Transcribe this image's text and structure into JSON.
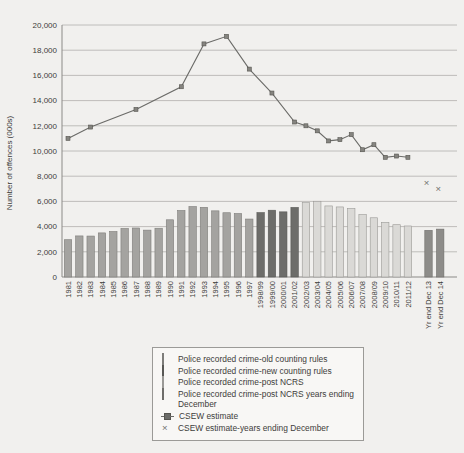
{
  "colors": {
    "background": "#f1f0ee",
    "bar_old": "#a4a3a0",
    "bar_old_stroke": "#7e7d7a",
    "bar_new": "#6d6d6a",
    "bar_new_stroke": "#585855",
    "bar_ncrs": "#dad9d6",
    "bar_ncrs_stroke": "#9a9996",
    "bar_ncrs_dec": "#8d8c89",
    "bar_ncrs_dec_stroke": "#6e6d6a",
    "line": "#6b6b68",
    "line_marker_fill": "#85847f",
    "line_marker_stroke": "#55544f",
    "x_marker": "#6f6f6c",
    "grid": "#b9b7b4",
    "axis": "#8b8a87",
    "text": "#3e3d3b",
    "legend_border": "#9b9a97",
    "legend_bg": "#f8f7f5"
  },
  "markers": {
    "x_glyph": "×"
  },
  "chart_data": {
    "type": "bar+line",
    "title": "",
    "xlabel": "",
    "ylabel": "Number of offences (000s)",
    "ylim": [
      0,
      20000
    ],
    "grid": "horizontal",
    "ytick_values": [
      0,
      2000,
      4000,
      6000,
      8000,
      10000,
      12000,
      14000,
      16000,
      18000,
      20000
    ],
    "ytick_labels": [
      "0",
      "2,000",
      "4,000",
      "6,000",
      "8,000",
      "10,000",
      "12,000",
      "14,000",
      "16,000",
      "18,000",
      "20,000"
    ],
    "categories": [
      "1981",
      "1982",
      "1983",
      "1984",
      "1985",
      "1986",
      "1987",
      "1988",
      "1989",
      "1990",
      "1991",
      "1992",
      "1993",
      "1994",
      "1995",
      "1996",
      "1997",
      "1998/99",
      "1999/00",
      "2000/01",
      "2001/02",
      "2002/03",
      "2003/04",
      "2004/05",
      "2005/06",
      "2006/07",
      "2007/08",
      "2008/09",
      "2009/10",
      "2010/11",
      "2011/12",
      "Yr end Dec 13",
      "Yr end Dec 14"
    ],
    "bar_values": [
      2960,
      3260,
      3250,
      3500,
      3610,
      3850,
      3890,
      3720,
      3870,
      4540,
      5280,
      5590,
      5530,
      5250,
      5100,
      5040,
      4600,
      5110,
      5300,
      5170,
      5520,
      5900,
      6010,
      5640,
      5560,
      5430,
      4950,
      4700,
      4340,
      4150,
      4050,
      3700,
      3800
    ],
    "bar_groups": [
      "old",
      "old",
      "old",
      "old",
      "old",
      "old",
      "old",
      "old",
      "old",
      "old",
      "old",
      "old",
      "old",
      "old",
      "old",
      "old",
      "old",
      "new",
      "new",
      "new",
      "new",
      "ncrs",
      "ncrs",
      "ncrs",
      "ncrs",
      "ncrs",
      "ncrs",
      "ncrs",
      "ncrs",
      "ncrs",
      "ncrs",
      "ncrs_dec",
      "ncrs_dec"
    ],
    "bar_series_names": {
      "old": "Police recorded crime-old counting rules",
      "new": "Police recorded crime-new counting rules",
      "ncrs": "Police recorded crime-post NCRS",
      "ncrs_dec": "Police recorded crime-post NCRS years ending December"
    },
    "line_series": {
      "name": "CSEW estimate",
      "points": [
        [
          "1981",
          11000
        ],
        [
          "1983",
          11900
        ],
        [
          "1987",
          13300
        ],
        [
          "1991",
          15100
        ],
        [
          "1993",
          18500
        ],
        [
          "1995",
          19100
        ],
        [
          "1997",
          16500
        ],
        [
          "1999/00",
          14600
        ],
        [
          "2001/02",
          12300
        ],
        [
          "2002/03",
          12000
        ],
        [
          "2003/04",
          11600
        ],
        [
          "2004/05",
          10800
        ],
        [
          "2005/06",
          10900
        ],
        [
          "2006/07",
          11300
        ],
        [
          "2007/08",
          10100
        ],
        [
          "2008/09",
          10500
        ],
        [
          "2009/10",
          9500
        ],
        [
          "2010/11",
          9600
        ],
        [
          "2011/12",
          9500
        ]
      ]
    },
    "x_markers": {
      "name": "CSEW estimate-years ending December",
      "points": [
        [
          "Yr end Dec 13",
          7500
        ],
        [
          "Yr end Dec 14",
          7000
        ]
      ]
    }
  },
  "legend": {
    "items": [
      {
        "label": "Police recorded crime-old counting rules",
        "marker": "bar_old"
      },
      {
        "label": "Police recorded crime-new counting rules",
        "marker": "bar_new"
      },
      {
        "label": "Police recorded crime-post NCRS",
        "marker": "bar_ncrs"
      },
      {
        "label": "Police recorded crime-post NCRS years ending December",
        "marker": "bar_ncrs_dec"
      },
      {
        "label": "CSEW estimate",
        "marker": "line"
      },
      {
        "label": "CSEW estimate-years ending December",
        "marker": "x",
        "glyph": "×"
      }
    ]
  }
}
